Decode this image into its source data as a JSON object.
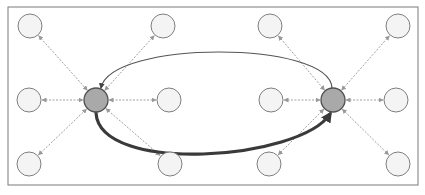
{
  "diagram": {
    "title": "",
    "frame": {
      "x": 8,
      "y": 7,
      "w": 410,
      "h": 178,
      "stroke": "#7a7a7a"
    },
    "colors": {
      "hub_fill": "#a9a9a9",
      "hub_stroke": "#505050",
      "leaf_fill": "#f4f4f4",
      "leaf_stroke": "#7f7f7f",
      "spoke": "#a0a0a0",
      "thin_curve": "#555555",
      "thick_curve": "#3a3a3a"
    },
    "hubs": [
      {
        "id": "hub-left",
        "x": 96,
        "y": 100,
        "r": 12
      },
      {
        "id": "hub-right",
        "x": 333,
        "y": 100,
        "r": 12
      }
    ],
    "leaves": [
      {
        "id": "leaf-tl1",
        "x": 30,
        "y": 26,
        "hub": 0
      },
      {
        "id": "leaf-tl2",
        "x": 163,
        "y": 26,
        "hub": 0
      },
      {
        "id": "leaf-ml1",
        "x": 29,
        "y": 100,
        "hub": 0
      },
      {
        "id": "leaf-ml2",
        "x": 169,
        "y": 100,
        "hub": 0
      },
      {
        "id": "leaf-bl1",
        "x": 29,
        "y": 164,
        "hub": 0
      },
      {
        "id": "leaf-bl2",
        "x": 170,
        "y": 164,
        "hub": 0
      },
      {
        "id": "leaf-tr1",
        "x": 270,
        "y": 26,
        "hub": 1
      },
      {
        "id": "leaf-tr2",
        "x": 398,
        "y": 26,
        "hub": 1
      },
      {
        "id": "leaf-mr1",
        "x": 271,
        "y": 100,
        "hub": 1
      },
      {
        "id": "leaf-mr2",
        "x": 396,
        "y": 100,
        "hub": 1
      },
      {
        "id": "leaf-br1",
        "x": 269,
        "y": 164,
        "hub": 1
      },
      {
        "id": "leaf-br2",
        "x": 398,
        "y": 164,
        "hub": 1
      }
    ],
    "leaf_r": 12,
    "curves": [
      {
        "id": "thin-curve-right-to-left",
        "d": "M 332 88 C 330 40, 110 40, 101 88",
        "width": 1.2
      },
      {
        "id": "thick-curve-left-to-right",
        "d": "M 96 113 C 100 175, 300 160, 330 114",
        "width": 3.2
      }
    ]
  }
}
